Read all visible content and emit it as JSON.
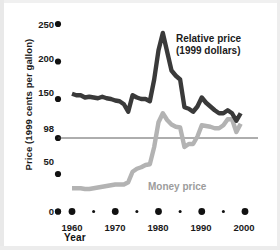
{
  "chart_data": {
    "type": "line",
    "title": "",
    "xlabel": "Year",
    "ylabel": "Price (1999 cents per gallon)",
    "xlim": [
      1957,
      2001
    ],
    "ylim": [
      0,
      258
    ],
    "grid": false,
    "legend_position": "inline-annotations",
    "x_ticks": [
      1960,
      1970,
      1980,
      1990,
      2000
    ],
    "x_minor_ticks": [
      1965,
      1975,
      1985,
      1995
    ],
    "y_ticks": [
      0,
      50,
      98,
      150,
      200,
      250
    ],
    "reference_line": {
      "value": 98,
      "label": "98",
      "color": "#3a3a3a"
    },
    "colors": {
      "relative_price": "#3a3a3a",
      "money_price": "#b3b3b3",
      "axis_text": "#1a1a1a"
    },
    "series": [
      {
        "name": "Relative price (1999 dollars)",
        "color": "#3a3a3a",
        "x": [
          1960,
          1961,
          1962,
          1963,
          1964,
          1965,
          1966,
          1967,
          1968,
          1969,
          1970,
          1971,
          1972,
          1973,
          1974,
          1975,
          1976,
          1977,
          1978,
          1979,
          1980,
          1981,
          1982,
          1983,
          1984,
          1985,
          1986,
          1987,
          1988,
          1989,
          1990,
          1991,
          1992,
          1993,
          1994,
          1995,
          1996,
          1997,
          1998,
          1999
        ],
        "values": [
          157,
          155,
          155,
          152,
          153,
          152,
          151,
          153,
          151,
          150,
          148,
          147,
          143,
          133,
          155,
          152,
          150,
          150,
          147,
          176,
          215,
          238,
          213,
          188,
          181,
          176,
          139,
          137,
          133,
          140,
          152,
          145,
          140,
          135,
          131,
          131,
          135,
          131,
          121,
          131
        ]
      },
      {
        "name": "Money price",
        "color": "#b3b3b3",
        "x": [
          1960,
          1961,
          1962,
          1963,
          1964,
          1965,
          1966,
          1967,
          1968,
          1969,
          1970,
          1971,
          1972,
          1973,
          1974,
          1975,
          1976,
          1977,
          1978,
          1979,
          1980,
          1981,
          1982,
          1983,
          1984,
          1985,
          1986,
          1987,
          1988,
          1989,
          1990,
          1991,
          1992,
          1993,
          1994,
          1995,
          1996,
          1997,
          1998,
          1999
        ],
        "values": [
          31,
          31,
          31,
          30,
          30,
          31,
          32,
          33,
          34,
          35,
          36,
          36,
          36,
          39,
          53,
          57,
          59,
          62,
          63,
          86,
          119,
          131,
          122,
          116,
          113,
          112,
          86,
          90,
          90,
          100,
          115,
          114,
          113,
          111,
          111,
          115,
          123,
          123,
          106,
          117
        ]
      }
    ]
  },
  "axes": {
    "y_title": "Price (1999 cents per gallon)",
    "x_title": "Year",
    "y_tick_labels": [
      "250",
      "200",
      "150",
      "98",
      "50",
      "0"
    ],
    "x_tick_labels": [
      "1960",
      "1970",
      "1980",
      "1990",
      "2000"
    ]
  },
  "annotations": {
    "relative_price_line1": "Relative price",
    "relative_price_line2": "(1999 dollars)",
    "money_price": "Money price"
  }
}
